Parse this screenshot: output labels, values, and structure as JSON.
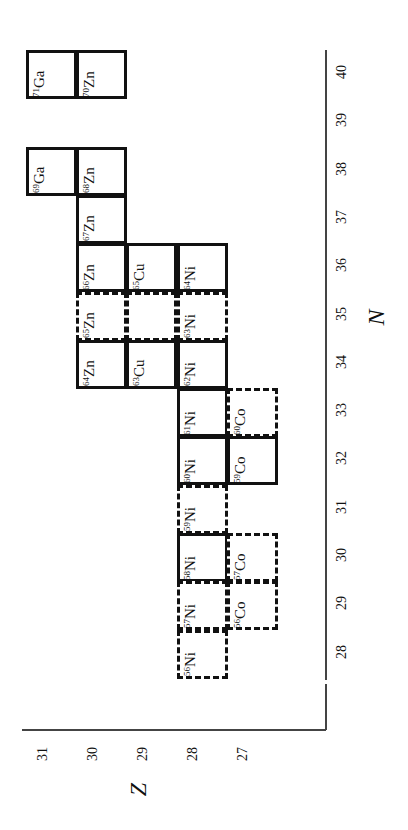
{
  "chart_data": {
    "type": "table",
    "title": "",
    "xlabel": "Z",
    "ylabel": "N",
    "orientation": "rotated 90 degrees: Z runs horizontally (decreasing left to right), N runs vertically (decreasing top to bottom)",
    "z_ticks": [
      "31",
      "30",
      "29",
      "28",
      "27"
    ],
    "n_ticks": [
      "40",
      "39",
      "38",
      "37",
      "36",
      "35",
      "34",
      "33",
      "32",
      "31",
      "30",
      "29",
      "28"
    ],
    "cells": [
      {
        "mass": "71",
        "el": "Ga",
        "Z": 31,
        "N": 40,
        "style": "solid"
      },
      {
        "mass": "70",
        "el": "Zn",
        "Z": 30,
        "N": 40,
        "style": "solid"
      },
      {
        "mass": "69",
        "el": "Ga",
        "Z": 31,
        "N": 38,
        "style": "solid"
      },
      {
        "mass": "68",
        "el": "Zn",
        "Z": 30,
        "N": 38,
        "style": "solid"
      },
      {
        "mass": "67",
        "el": "Zn",
        "Z": 30,
        "N": 37,
        "style": "solid"
      },
      {
        "mass": "66",
        "el": "Zn",
        "Z": 30,
        "N": 36,
        "style": "solid"
      },
      {
        "mass": "65",
        "el": "Cu",
        "Z": 29,
        "N": 36,
        "style": "solid"
      },
      {
        "mass": "64",
        "el": "Ni",
        "Z": 28,
        "N": 36,
        "style": "solid"
      },
      {
        "mass": "65",
        "el": "Zn",
        "Z": 30,
        "N": 35,
        "style": "dashed"
      },
      {
        "mass": "",
        "el": "",
        "Z": 29,
        "N": 35,
        "style": "dashed"
      },
      {
        "mass": "63",
        "el": "Ni",
        "Z": 28,
        "N": 35,
        "style": "dashed"
      },
      {
        "mass": "64",
        "el": "Zn",
        "Z": 30,
        "N": 34,
        "style": "solid"
      },
      {
        "mass": "63",
        "el": "Cu",
        "Z": 29,
        "N": 34,
        "style": "solid"
      },
      {
        "mass": "62",
        "el": "Ni",
        "Z": 28,
        "N": 34,
        "style": "solid"
      },
      {
        "mass": "61",
        "el": "Ni",
        "Z": 28,
        "N": 33,
        "style": "solid"
      },
      {
        "mass": "60",
        "el": "Co",
        "Z": 27,
        "N": 33,
        "style": "dashed"
      },
      {
        "mass": "60",
        "el": "Ni",
        "Z": 28,
        "N": 32,
        "style": "solid"
      },
      {
        "mass": "59",
        "el": "Co",
        "Z": 27,
        "N": 32,
        "style": "solid"
      },
      {
        "mass": "59",
        "el": "Ni",
        "Z": 28,
        "N": 31,
        "style": "dashed"
      },
      {
        "mass": "58",
        "el": "Ni",
        "Z": 28,
        "N": 30,
        "style": "solid"
      },
      {
        "mass": "57",
        "el": "Co",
        "Z": 27,
        "N": 30,
        "style": "dashed"
      },
      {
        "mass": "57",
        "el": "Ni",
        "Z": 28,
        "N": 29,
        "style": "dashed"
      },
      {
        "mass": "56",
        "el": "Co",
        "Z": 27,
        "N": 29,
        "style": "dashed"
      },
      {
        "mass": "56",
        "el": "Ni",
        "Z": 28,
        "N": 28,
        "style": "dashed"
      }
    ]
  },
  "axes": {
    "z_title": "Z",
    "n_title": "N"
  }
}
